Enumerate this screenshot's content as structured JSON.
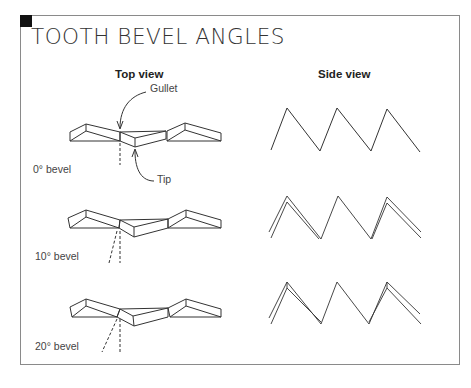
{
  "title": "TOOTH BEVEL ANGLES",
  "columns": {
    "top_view": "Top view",
    "side_view": "Side view"
  },
  "callouts": {
    "gullet": "Gullet",
    "tip": "Tip"
  },
  "rows": [
    {
      "label": "0° bevel",
      "angle": 0
    },
    {
      "label": "10° bevel",
      "angle": 10
    },
    {
      "label": "20° bevel",
      "angle": 20
    }
  ],
  "colors": {
    "line": "#333333",
    "frame": "#8a8a8a",
    "corner": "#111111"
  }
}
